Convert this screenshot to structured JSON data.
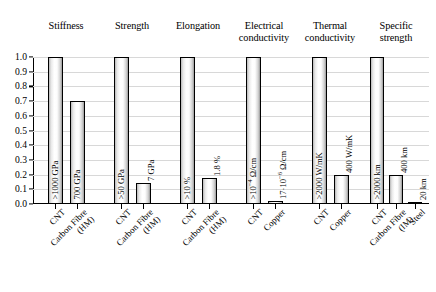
{
  "chart_data": {
    "type": "bar",
    "title": "",
    "subtitle": "",
    "xlabel": "",
    "ylabel": "",
    "ylim": [
      0.0,
      1.0
    ],
    "grid": true,
    "legend": "none",
    "normalized": true,
    "ytick_labels": [
      "1.0",
      "0.9",
      "0.8",
      "0.7",
      "0.6",
      "0.5",
      "0.4",
      "0.3",
      "0.2",
      "0.1",
      "0.0"
    ],
    "ytick_values": [
      1.0,
      0.9,
      0.8,
      0.7,
      0.6,
      0.5,
      0.4,
      0.3,
      0.2,
      0.1,
      0.0
    ],
    "groups": [
      {
        "title_lines": [
          "Stiffness"
        ],
        "bars": [
          {
            "category": "CNT",
            "category_lines": [
              "CNT"
            ],
            "value": 1.0,
            "data_label": "&gt;1000 GPa",
            "label_inside": true
          },
          {
            "category": "Carbon Fibre (HM)",
            "category_lines": [
              "Carbon Fibre",
              "(HM)"
            ],
            "value": 0.7,
            "data_label": "700 GPa",
            "label_inside": true
          }
        ]
      },
      {
        "title_lines": [
          "Strength"
        ],
        "bars": [
          {
            "category": "CNT",
            "category_lines": [
              "CNT"
            ],
            "value": 1.0,
            "data_label": "&gt;50 GPa",
            "label_inside": true
          },
          {
            "category": "Carbon Fibre (HM)",
            "category_lines": [
              "Carbon Fibre",
              "(HM)"
            ],
            "value": 0.14,
            "data_label": "7 GPa",
            "label_inside": false
          }
        ]
      },
      {
        "title_lines": [
          "Elongation"
        ],
        "bars": [
          {
            "category": "CNT",
            "category_lines": [
              "CNT"
            ],
            "value": 1.0,
            "data_label": "&gt;10 %",
            "label_inside": true
          },
          {
            "category": "Carbon Fibre (HM)",
            "category_lines": [
              "Carbon Fibre",
              "(HM)"
            ],
            "value": 0.18,
            "data_label": "1.8 %",
            "label_inside": false
          }
        ]
      },
      {
        "title_lines": [
          "Electrical",
          "conductivity"
        ],
        "bars": [
          {
            "category": "CNT",
            "category_lines": [
              "CNT"
            ],
            "value": 1.0,
            "data_label": "&gt;10<sup>&minus;4</sup> &Omega;/cm",
            "label_inside": true
          },
          {
            "category": "Copper",
            "category_lines": [
              "Copper"
            ],
            "value": 0.018,
            "data_label": "17&middot;10<sup>&minus;6</sup> &Omega;/cm",
            "label_inside": false
          }
        ]
      },
      {
        "title_lines": [
          "Thermal",
          "conductivity"
        ],
        "bars": [
          {
            "category": "CNT",
            "category_lines": [
              "CNT"
            ],
            "value": 1.0,
            "data_label": "&gt;2000 W/mK",
            "label_inside": true
          },
          {
            "category": "Copper",
            "category_lines": [
              "Copper"
            ],
            "value": 0.2,
            "data_label": "400 W/mK",
            "label_inside": false
          }
        ]
      },
      {
        "title_lines": [
          "Specific",
          "strength"
        ],
        "bars": [
          {
            "category": "CNT",
            "category_lines": [
              "CNT"
            ],
            "value": 1.0,
            "data_label": "&gt;2000 km",
            "label_inside": true
          },
          {
            "category": "Carbon Fibre (IM)",
            "category_lines": [
              "Carbon Fibre",
              "(IM)"
            ],
            "value": 0.2,
            "data_label": "400 km",
            "label_inside": false
          },
          {
            "category": "Steel",
            "category_lines": [
              "Steel"
            ],
            "value": 0.01,
            "data_label": "20 km",
            "label_inside": false
          }
        ]
      }
    ]
  },
  "style": {
    "bar_outline": "#000000",
    "grid_color": "#d8d8d8",
    "axis_color": "#000000",
    "background": "#ffffff"
  }
}
